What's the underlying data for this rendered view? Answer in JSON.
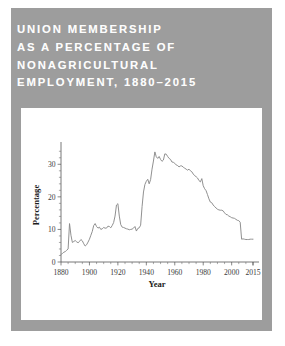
{
  "card": {
    "background_color": "#9d9d9d",
    "panel_color": "#ffffff",
    "page_color": "#ffffff"
  },
  "title": {
    "color": "#fdfdfd",
    "lines": [
      "UNION MEMBERSHIP",
      "AS A PERCENTAGE OF",
      "NONAGRICULTURAL",
      "EMPLOYMENT, 1880–2015"
    ],
    "full_text": "UNION MEMBERSHIP AS A PERCENTAGE OF NONAGRICULTURAL EMPLOYMENT, 1880-2015"
  },
  "chart_data": {
    "type": "line",
    "xlabel": "Year",
    "ylabel": "Percentage",
    "xlim": [
      1880,
      2015
    ],
    "ylim": [
      0,
      35
    ],
    "grid": false,
    "legend": null,
    "line_color": "#8a8a8a",
    "xticks": [
      1880,
      1900,
      1920,
      1940,
      1960,
      1980,
      2000,
      2015
    ],
    "xtick_labels": [
      "1880",
      "1900",
      "1920",
      "1940",
      "1960",
      "1980",
      "2000",
      "2015"
    ],
    "x_minor_tick_step": 5,
    "yticks": [
      0,
      10,
      20,
      30
    ],
    "ytick_labels": [
      "0",
      "10",
      "20",
      "30"
    ],
    "y_minor_tick_step": 2,
    "series": [
      {
        "name": "Union membership share",
        "x": [
          1880,
          1881,
          1882,
          1883,
          1884,
          1885,
          1886,
          1887,
          1888,
          1889,
          1890,
          1891,
          1892,
          1893,
          1894,
          1895,
          1896,
          1897,
          1898,
          1899,
          1900,
          1901,
          1902,
          1903,
          1904,
          1905,
          1906,
          1907,
          1908,
          1909,
          1910,
          1911,
          1912,
          1913,
          1914,
          1915,
          1916,
          1917,
          1918,
          1919,
          1920,
          1921,
          1922,
          1923,
          1924,
          1925,
          1926,
          1927,
          1928,
          1929,
          1930,
          1931,
          1932,
          1933,
          1934,
          1935,
          1936,
          1937,
          1938,
          1939,
          1940,
          1941,
          1942,
          1943,
          1944,
          1945,
          1946,
          1947,
          1948,
          1949,
          1950,
          1951,
          1952,
          1953,
          1954,
          1955,
          1956,
          1957,
          1958,
          1959,
          1960,
          1961,
          1962,
          1963,
          1964,
          1965,
          1966,
          1967,
          1968,
          1969,
          1970,
          1971,
          1972,
          1973,
          1974,
          1975,
          1976,
          1977,
          1978,
          1979,
          1980,
          1981,
          1982,
          1983,
          1984,
          1985,
          1986,
          1987,
          1988,
          1989,
          1990,
          1991,
          1992,
          1993,
          1994,
          1995,
          1996,
          1997,
          1998,
          1999,
          2000,
          2001,
          2002,
          2003,
          2004,
          2005,
          2006,
          2007,
          2008,
          2009,
          2010,
          2011,
          2012,
          2013,
          2014,
          2015
        ],
        "y": [
          2.3,
          2.6,
          3.0,
          3.2,
          3.6,
          4.0,
          11.8,
          8.2,
          6.0,
          6.3,
          6.6,
          6.2,
          5.9,
          6.3,
          6.9,
          6.5,
          5.6,
          4.9,
          5.3,
          6.1,
          7.0,
          8.2,
          9.4,
          11.2,
          11.8,
          10.9,
          10.4,
          10.7,
          10.0,
          10.2,
          10.6,
          10.4,
          10.4,
          11.0,
          10.9,
          10.5,
          11.2,
          12.1,
          14.1,
          17.5,
          17.9,
          14.1,
          11.5,
          10.7,
          10.6,
          10.4,
          10.2,
          10.1,
          9.9,
          10.0,
          10.1,
          10.4,
          10.9,
          9.5,
          10.3,
          10.5,
          11.3,
          17.0,
          21.5,
          23.8,
          24.8,
          25.4,
          24.0,
          25.3,
          28.5,
          31.0,
          33.8,
          32.3,
          31.8,
          32.4,
          31.5,
          30.9,
          31.3,
          33.2,
          33.1,
          32.4,
          31.8,
          31.5,
          30.7,
          30.6,
          30.3,
          29.8,
          29.6,
          29.2,
          29.5,
          29.5,
          29.1,
          28.8,
          28.5,
          28.2,
          28.5,
          28.0,
          27.7,
          27.0,
          26.5,
          26.2,
          25.8,
          25.0,
          24.6,
          25.6,
          23.4,
          22.5,
          21.9,
          20.7,
          19.4,
          18.4,
          18.2,
          17.5,
          17.0,
          16.6,
          16.2,
          16.0,
          15.9,
          15.9,
          15.7,
          15.1,
          14.6,
          14.5,
          14.1,
          13.9,
          13.6,
          13.5,
          13.4,
          13.1,
          12.8,
          12.7,
          12.2,
          7.0,
          7.1,
          7.0,
          6.9,
          6.9,
          6.9,
          7.0,
          7.0,
          7.0
        ]
      }
    ]
  }
}
